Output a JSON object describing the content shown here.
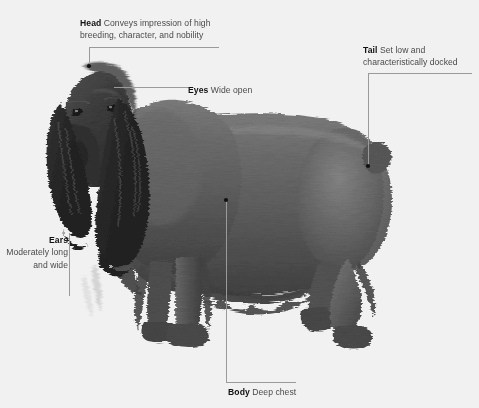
{
  "figure": {
    "background_color": "#ffffff",
    "image_style": "grayscale photograph",
    "leader_line_color": "#9a9a9a",
    "leader_dot_color": "#111111",
    "term_color": "#111111",
    "desc_color": "#4a4a4a"
  },
  "callouts": [
    {
      "id": "head",
      "term": "Head",
      "desc": "Conveys impression of high breeding, character, and nobility",
      "anchor": "top-of-skull"
    },
    {
      "id": "eyes",
      "term": "Eyes",
      "desc": "Wide open",
      "anchor": "eye"
    },
    {
      "id": "tail",
      "term": "Tail",
      "desc": "Set low and characteristically docked",
      "anchor": "tail"
    },
    {
      "id": "ears",
      "term": "Ears",
      "desc": "Moderately long and wide",
      "anchor": "ear"
    },
    {
      "id": "body",
      "term": "Body",
      "desc": "Deep chest",
      "anchor": "chest"
    }
  ]
}
